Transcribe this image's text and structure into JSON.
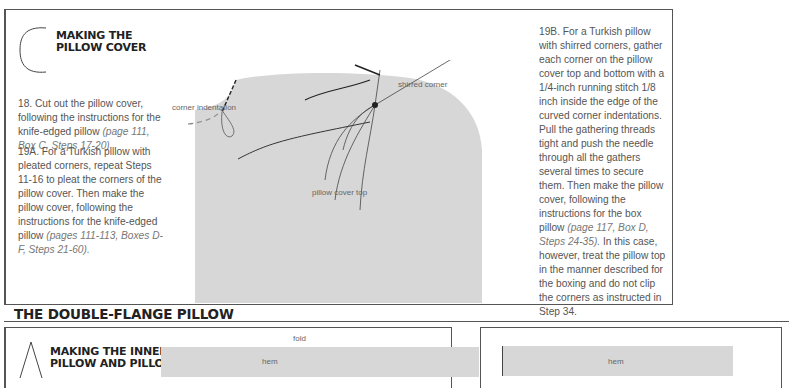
{
  "top_section": {
    "letter": "C",
    "heading_line1": "MAKING THE",
    "heading_line2": "PILLOW COVER",
    "step18": {
      "text": "18. Cut out the pillow cover, following the instructions for the knife-edged pillow ",
      "ref": "(page 111, Box C, Steps 17-20)."
    },
    "step19a": {
      "text": "19A. For a Turkish pillow with pleated corners, repeat Steps 11-16 to pleat the corners of the pillow cover. Then make the pillow cover, following the instructions for the knife-edged pillow ",
      "ref": "(pages 111-113, Boxes D-F, Steps 21-60)."
    },
    "step19b": {
      "text1": "19B. For a Turkish pillow with shirred corners, gather each corner on the pillow cover top and bottom with a 1/4-inch running stitch 1/8 inch inside the edge of the curved corner indentations. Pull the gathering threads tight and push the needle through all the gathers several times to secure them. Then make the pillow cover, following the instructions for the box pillow ",
      "ref": "(page 117, Box D, Steps 24-35).",
      "text2": " In this case, however, treat the pillow top in the manner described for the boxing and do not clip the corners as instructed in Step 34."
    },
    "illustration": {
      "label_corner_indentation": "corner indentation",
      "label_shirred_corner": "shirred corner",
      "label_pillow_cover_top": "pillow cover top",
      "fill_color": "#d7d7d7"
    }
  },
  "bottom_section": {
    "title": "THE DOUBLE-FLANGE PILLOW",
    "letter": "A",
    "heading_line1": "MAKING THE INNER",
    "heading_line2": "PILLOW AND PILLOW",
    "label_fold": "fold",
    "label_hem_left": "hem",
    "label_hem_right": "hem"
  }
}
